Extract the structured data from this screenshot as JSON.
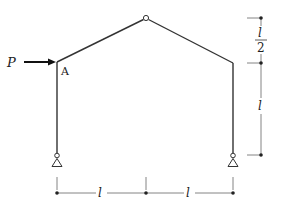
{
  "diagram": {
    "type": "three-hinged gable frame",
    "load": {
      "label": "P",
      "direction": "right",
      "applied_at": "A"
    },
    "joint_label": "A",
    "dimensions": {
      "horizontal": [
        "l",
        "l"
      ],
      "vertical_rise": {
        "numerator": "l",
        "denominator": "2"
      },
      "vertical_column": "l"
    },
    "supports": [
      "pin",
      "pin"
    ],
    "crown": "hinge",
    "colors": {
      "line": "#333333",
      "dimension": "#555555",
      "background": "#ffffff"
    }
  }
}
